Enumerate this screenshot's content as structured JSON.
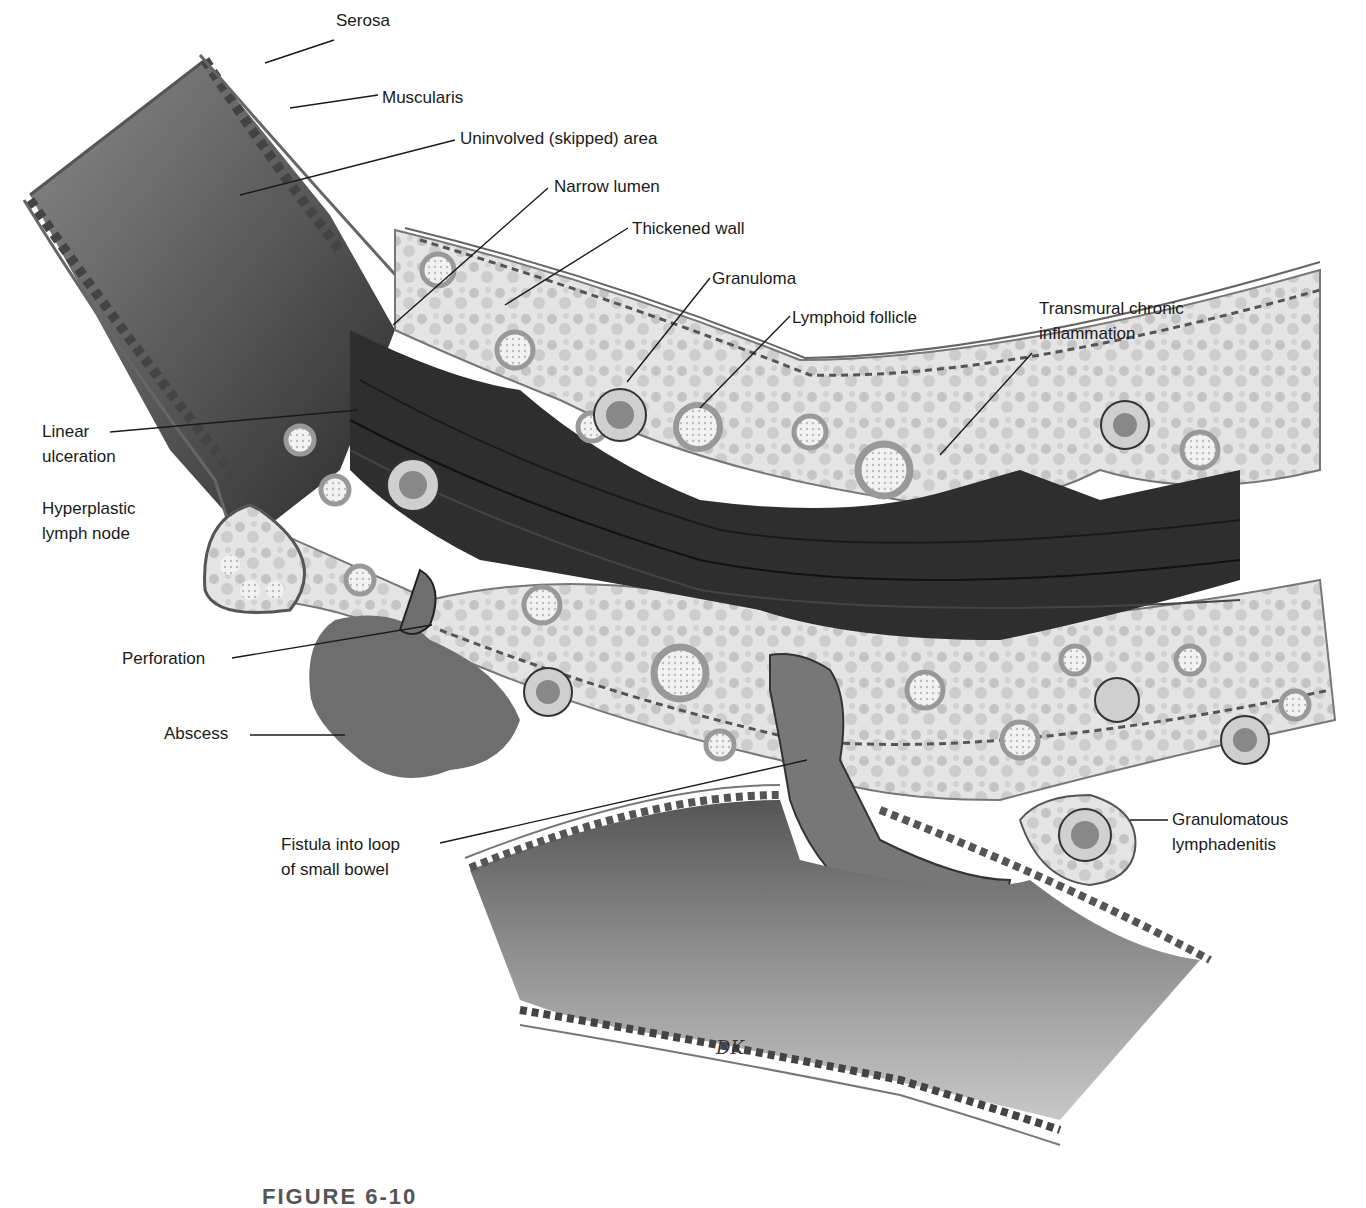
{
  "figure": {
    "caption_partial": "FIGURE 6-10",
    "artist_signature": "DK",
    "colors": {
      "background": "#ffffff",
      "mucosa_dark": "#2e2e2e",
      "mucosa_mid": "#6a6a6a",
      "wall_light": "#d9d9d9",
      "abscess": "#707070",
      "label_text": "#1a1a1a"
    }
  },
  "labels": {
    "serosa": "Serosa",
    "muscularis": "Muscularis",
    "uninvolved": "Uninvolved (skipped) area",
    "narrow_lumen": "Narrow lumen",
    "thickened_wall": "Thickened wall",
    "granuloma": "Granuloma",
    "lymphoid_follicle": "Lymphoid follicle",
    "transmural_1": "Transmural chronic",
    "transmural_2": "inflammation",
    "linear_1": "Linear",
    "linear_2": "ulceration",
    "hyperplastic_1": "Hyperplastic",
    "hyperplastic_2": "lymph node",
    "perforation": "Perforation",
    "abscess": "Abscess",
    "fistula_1": "Fistula into loop",
    "fistula_2": "of small bowel",
    "granulomatous_1": "Granulomatous",
    "granulomatous_2": "lymphadenitis"
  }
}
